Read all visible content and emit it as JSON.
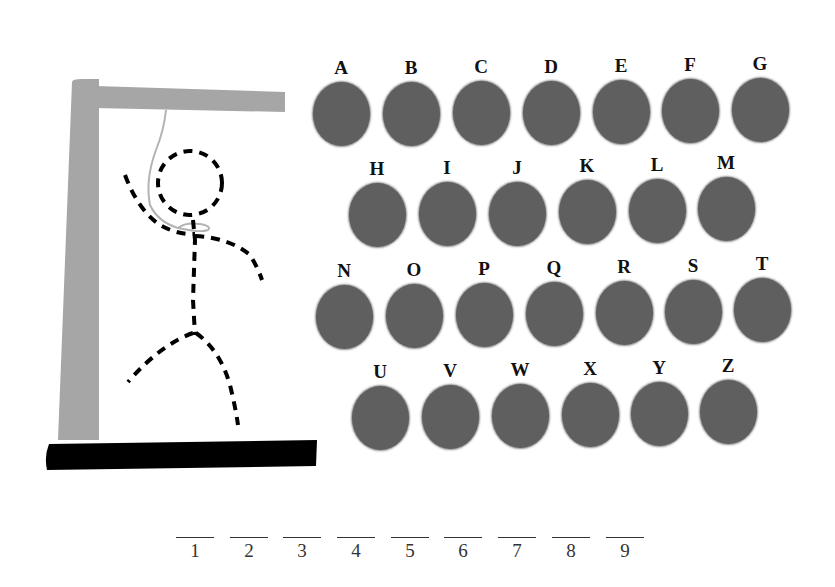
{
  "game": "Hangman",
  "colors": {
    "gallows": "#a6a6a6",
    "base": "#000000",
    "disc": "#5f5f5f",
    "rope": "#b3b3b3",
    "figure": "#000000"
  },
  "letters": [
    {
      "label": "A",
      "x": 311,
      "y": 58
    },
    {
      "label": "B",
      "x": 381,
      "y": 58
    },
    {
      "label": "C",
      "x": 451,
      "y": 57
    },
    {
      "label": "D",
      "x": 521,
      "y": 57
    },
    {
      "label": "E",
      "x": 591,
      "y": 56
    },
    {
      "label": "F",
      "x": 660,
      "y": 55
    },
    {
      "label": "G",
      "x": 730,
      "y": 54
    },
    {
      "label": "H",
      "x": 347,
      "y": 159
    },
    {
      "label": "I",
      "x": 417,
      "y": 158
    },
    {
      "label": "J",
      "x": 487,
      "y": 158
    },
    {
      "label": "K",
      "x": 557,
      "y": 156
    },
    {
      "label": "L",
      "x": 627,
      "y": 155
    },
    {
      "label": "M",
      "x": 696,
      "y": 153
    },
    {
      "label": "N",
      "x": 314,
      "y": 261
    },
    {
      "label": "O",
      "x": 384,
      "y": 260
    },
    {
      "label": "P",
      "x": 454,
      "y": 259
    },
    {
      "label": "Q",
      "x": 524,
      "y": 258
    },
    {
      "label": "R",
      "x": 594,
      "y": 257
    },
    {
      "label": "S",
      "x": 663,
      "y": 256
    },
    {
      "label": "T",
      "x": 732,
      "y": 254
    },
    {
      "label": "U",
      "x": 350,
      "y": 362
    },
    {
      "label": "V",
      "x": 420,
      "y": 361
    },
    {
      "label": "W",
      "x": 490,
      "y": 360
    },
    {
      "label": "X",
      "x": 560,
      "y": 359
    },
    {
      "label": "Y",
      "x": 629,
      "y": 358
    },
    {
      "label": "Z",
      "x": 698,
      "y": 356
    }
  ],
  "word_slots": [
    {
      "number": "1",
      "x": 176
    },
    {
      "number": "2",
      "x": 230
    },
    {
      "number": "3",
      "x": 283
    },
    {
      "number": "4",
      "x": 337
    },
    {
      "number": "5",
      "x": 391
    },
    {
      "number": "6",
      "x": 444
    },
    {
      "number": "7",
      "x": 498
    },
    {
      "number": "8",
      "x": 552
    },
    {
      "number": "9",
      "x": 606
    }
  ]
}
